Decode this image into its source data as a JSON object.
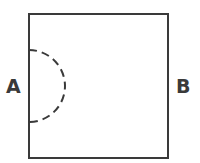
{
  "diagram": {
    "labels": {
      "left": "A",
      "right": "B"
    },
    "square": {
      "x": 29,
      "y": 14,
      "width": 139,
      "height": 144,
      "stroke": "#3a3a3a",
      "stroke_width": 2
    },
    "semicircle": {
      "center_x": 29,
      "center_y": 86,
      "radius": 36,
      "style": "dashed",
      "stroke": "#3a3a3a"
    },
    "colors": {
      "background": "#ffffff",
      "line": "#3a3a3a"
    }
  }
}
